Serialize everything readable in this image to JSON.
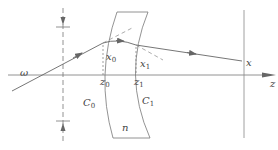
{
  "diagram": {
    "type": "optical ray diagram through a lens",
    "colors": {
      "line": "#666666",
      "text": "#444444",
      "background": "#ffffff"
    },
    "labels": {
      "omega": "ω",
      "x0_base": "x",
      "x0_sub": "0",
      "z0_base": "z",
      "z0_sub": "0",
      "x1_base": "x",
      "x1_sub": "1",
      "z1_base": "z",
      "z1_sub": "1",
      "c0_base": "C",
      "c0_sub": "0",
      "c1_base": "C",
      "c1_sub": "1",
      "n": "n",
      "x": "x",
      "z_axis": "z"
    }
  }
}
